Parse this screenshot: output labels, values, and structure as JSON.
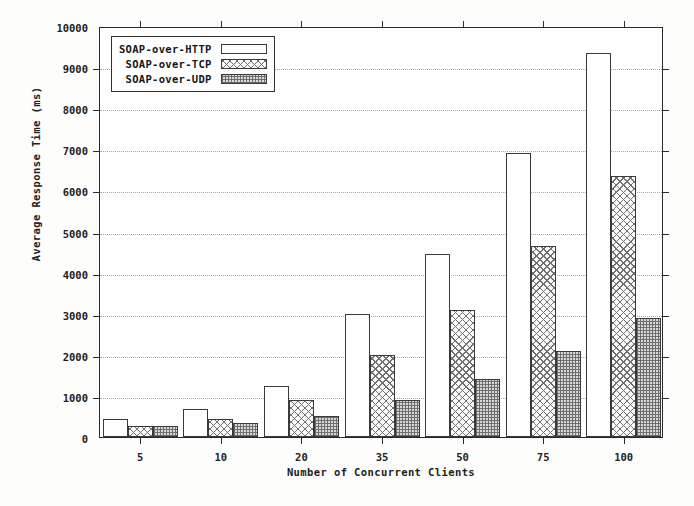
{
  "chart_data": {
    "type": "bar",
    "title": "",
    "xlabel": "Number of Concurrent Clients",
    "ylabel": "Average Response Time (ms)",
    "categories": [
      "5",
      "10",
      "20",
      "35",
      "50",
      "75",
      "100"
    ],
    "series": [
      {
        "name": "SOAP-over-HTTP",
        "pattern": "empty",
        "values": [
          430,
          690,
          1250,
          3000,
          4450,
          6900,
          9350
        ]
      },
      {
        "name": "SOAP-over-TCP",
        "pattern": "crosshatch",
        "values": [
          280,
          440,
          900,
          2000,
          3100,
          4650,
          6350
        ]
      },
      {
        "name": "SOAP-over-UDP",
        "pattern": "stipple",
        "values": [
          270,
          350,
          520,
          890,
          1400,
          2100,
          2900
        ]
      }
    ],
    "ylim": [
      0,
      10000
    ],
    "ytick_values": [
      0,
      1000,
      2000,
      3000,
      4000,
      5000,
      6000,
      7000,
      8000,
      9000,
      10000
    ],
    "ytick_labels": [
      "0",
      "1000",
      "2000",
      "3000",
      "4000",
      "5000",
      "6000",
      "7000",
      "8000",
      "9000",
      "10000"
    ],
    "grid": "horizontal-dotted",
    "legend_position": "top-left-inside"
  },
  "legend": {
    "items": [
      {
        "label": "SOAP-over-HTTP"
      },
      {
        "label": "SOAP-over-TCP"
      },
      {
        "label": "SOAP-over-UDP"
      }
    ]
  },
  "colors": {
    "axis": "#2a2a2a",
    "grid": "#a9a9a9",
    "bar_outline": "#3a3a3a",
    "background": "#ffffff",
    "text": "#222222"
  }
}
